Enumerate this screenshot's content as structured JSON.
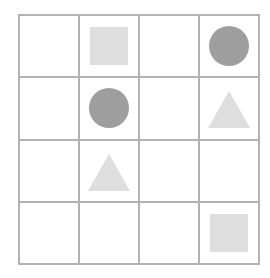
{
  "canvas": {
    "width": 270,
    "height": 278,
    "background_color": "#ffffff"
  },
  "grid": {
    "name": "shape-grid",
    "rows": 4,
    "columns": 4,
    "line_color": "#b2b2b2",
    "line_width_px": 2,
    "cell_background": "#ffffff"
  },
  "palette": {
    "light_gray": "#dedede",
    "medium_gray": "#9e9e9e",
    "grid_line": "#b2b2b2",
    "background": "#ffffff"
  },
  "cells": [
    {
      "row": 1,
      "col": 1,
      "shape": "empty",
      "color": null,
      "label": "empty cell"
    },
    {
      "row": 1,
      "col": 2,
      "shape": "square",
      "color": "#dedede",
      "label": "light gray square"
    },
    {
      "row": 1,
      "col": 3,
      "shape": "empty",
      "color": null,
      "label": "empty cell"
    },
    {
      "row": 1,
      "col": 4,
      "shape": "circle",
      "color": "#9e9e9e",
      "label": "gray circle"
    },
    {
      "row": 2,
      "col": 1,
      "shape": "empty",
      "color": null,
      "label": "empty cell"
    },
    {
      "row": 2,
      "col": 2,
      "shape": "circle",
      "color": "#9e9e9e",
      "label": "gray circle"
    },
    {
      "row": 2,
      "col": 3,
      "shape": "empty",
      "color": null,
      "label": "empty cell"
    },
    {
      "row": 2,
      "col": 4,
      "shape": "triangle",
      "color": "#dedede",
      "label": "light gray triangle"
    },
    {
      "row": 3,
      "col": 1,
      "shape": "empty",
      "color": null,
      "label": "empty cell"
    },
    {
      "row": 3,
      "col": 2,
      "shape": "triangle",
      "color": "#dedede",
      "label": "light gray triangle"
    },
    {
      "row": 3,
      "col": 3,
      "shape": "empty",
      "color": null,
      "label": "empty cell"
    },
    {
      "row": 3,
      "col": 4,
      "shape": "empty",
      "color": null,
      "label": "empty cell"
    },
    {
      "row": 4,
      "col": 1,
      "shape": "empty",
      "color": null,
      "label": "empty cell"
    },
    {
      "row": 4,
      "col": 2,
      "shape": "empty",
      "color": null,
      "label": "empty cell"
    },
    {
      "row": 4,
      "col": 3,
      "shape": "empty",
      "color": null,
      "label": "empty cell"
    },
    {
      "row": 4,
      "col": 4,
      "shape": "square",
      "color": "#dedede",
      "label": "light gray square"
    }
  ]
}
